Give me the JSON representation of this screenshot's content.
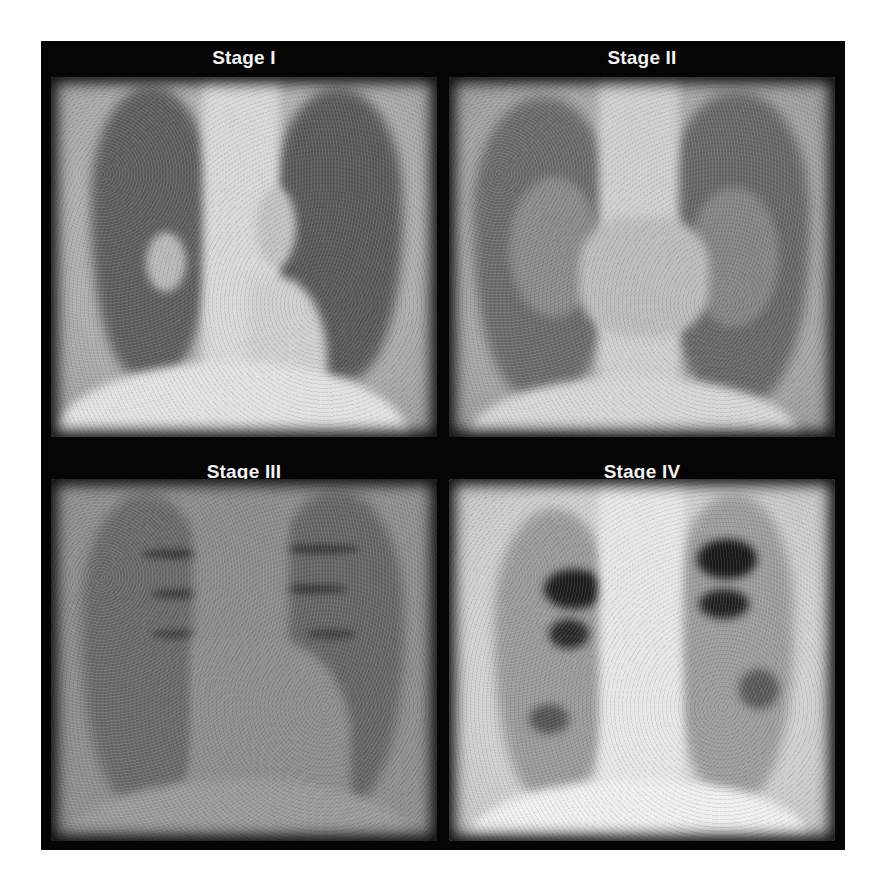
{
  "figure": {
    "layout": "2x2 grid",
    "background_color": "#ffffff",
    "frame_color": "#050505",
    "label_color": "#f2f2f2",
    "panels": [
      {
        "label": "Stage I",
        "description": "Frontal chest radiograph with bilateral hilar lymphadenopathy; clear lung fields",
        "tone": "#b4b4b4"
      },
      {
        "label": "Stage II",
        "description": "Frontal chest radiograph with hilar lymphadenopathy plus diffuse parenchymal opacities",
        "tone": "#a9a9a9"
      },
      {
        "label": "Stage III",
        "description": "Frontal chest radiograph with parenchymal reticulonodular opacities without hilar adenopathy",
        "tone": "#8e8e8e"
      },
      {
        "label": "Stage IV",
        "description": "Frontal chest radiograph with upper-lobe fibrosis, volume loss and cystic change",
        "tone": "#d0d0d0"
      }
    ]
  }
}
